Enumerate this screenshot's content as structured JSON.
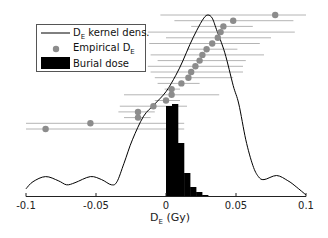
{
  "chart_data": {
    "type": "line",
    "title": "",
    "xlabel": "D_E (Gy)",
    "xlabel_main": "D",
    "xlabel_sub": "E",
    "xlabel_unit": " (Gy)",
    "ylabel": "",
    "xlim": [
      -0.1,
      0.1
    ],
    "x_ticks": [
      -0.1,
      -0.05,
      0,
      0.05,
      0.1
    ],
    "x_tick_labels": [
      "-0.1",
      "-0.05",
      "0",
      "0.05",
      "0.1"
    ],
    "grid": false,
    "legend_position": "upper left",
    "legend": [
      {
        "label_main": "D",
        "label_sub": "E",
        "label_rest": " kernel dens.",
        "type": "line",
        "color": "#000000"
      },
      {
        "label_main": "Empirical D",
        "label_sub": "E",
        "label_rest": "",
        "type": "marker",
        "color": "#8c8c8c"
      },
      {
        "label_main": "Burial dose",
        "label_sub": "",
        "label_rest": "",
        "type": "bar",
        "color": "#000000"
      }
    ],
    "series": [
      {
        "name": "D_E kernel dens.",
        "type": "line",
        "color": "#000000",
        "points": [
          [
            -0.1,
            0.07
          ],
          [
            -0.095,
            0.14
          ],
          [
            -0.086,
            0.19
          ],
          [
            -0.077,
            0.15
          ],
          [
            -0.071,
            0.11
          ],
          [
            -0.065,
            0.13
          ],
          [
            -0.054,
            0.19
          ],
          [
            -0.046,
            0.16
          ],
          [
            -0.039,
            0.11
          ],
          [
            -0.035,
            0.14
          ],
          [
            -0.03,
            0.32
          ],
          [
            -0.024,
            0.55
          ],
          [
            -0.016,
            0.78
          ],
          [
            -0.008,
            0.9
          ],
          [
            0.0,
            1.02
          ],
          [
            0.007,
            1.18
          ],
          [
            0.012,
            1.32
          ],
          [
            0.017,
            1.48
          ],
          [
            0.022,
            1.62
          ],
          [
            0.027,
            1.74
          ],
          [
            0.03,
            1.77
          ],
          [
            0.033,
            1.74
          ],
          [
            0.036,
            1.63
          ],
          [
            0.042,
            1.4
          ],
          [
            0.048,
            1.08
          ],
          [
            0.052,
            0.9
          ],
          [
            0.057,
            0.55
          ],
          [
            0.062,
            0.3
          ],
          [
            0.066,
            0.19
          ],
          [
            0.07,
            0.16
          ],
          [
            0.079,
            0.2
          ],
          [
            0.087,
            0.15
          ],
          [
            0.093,
            0.09
          ],
          [
            0.1,
            0.01
          ]
        ]
      },
      {
        "name": "Empirical D_E",
        "type": "errorbar_scatter",
        "color": "#8c8c8c",
        "points": [
          {
            "x": 0.078,
            "lo": -0.004,
            "hi": 0.1
          },
          {
            "x": 0.048,
            "lo": 0.006,
            "hi": 0.091
          },
          {
            "x": 0.041,
            "lo": 0.018,
            "hi": 0.062
          },
          {
            "x": 0.039,
            "lo": -0.013,
            "hi": 0.092
          },
          {
            "x": 0.037,
            "lo": 0.0,
            "hi": 0.075
          },
          {
            "x": 0.033,
            "lo": -0.012,
            "hi": 0.067
          },
          {
            "x": 0.029,
            "lo": 0.015,
            "hi": 0.051
          },
          {
            "x": 0.026,
            "lo": -0.011,
            "hi": 0.07
          },
          {
            "x": 0.024,
            "lo": -0.006,
            "hi": 0.057
          },
          {
            "x": 0.021,
            "lo": -0.013,
            "hi": 0.055
          },
          {
            "x": 0.018,
            "lo": -0.011,
            "hi": 0.055
          },
          {
            "x": 0.016,
            "lo": -0.008,
            "hi": 0.048
          },
          {
            "x": 0.011,
            "lo": -0.006,
            "hi": 0.024
          },
          {
            "x": 0.004,
            "lo": -0.001,
            "hi": 0.01
          },
          {
            "x": 0.004,
            "lo": -0.03,
            "hi": 0.038
          },
          {
            "x": 0.0,
            "lo": -0.008,
            "hi": 0.01
          },
          {
            "x": -0.009,
            "lo": -0.033,
            "hi": 0.015
          },
          {
            "x": -0.02,
            "lo": -0.034,
            "hi": -0.008
          },
          {
            "x": -0.02,
            "lo": -0.03,
            "hi": -0.011
          },
          {
            "x": -0.054,
            "lo": -0.1,
            "hi": 0.013
          },
          {
            "x": -0.086,
            "lo": -0.1,
            "hi": 0.013
          }
        ]
      },
      {
        "name": "Burial dose",
        "type": "bar",
        "color": "#000000",
        "bin_width": 0.0043,
        "bins": [
          0.0,
          0.0043,
          0.0086,
          0.0129,
          0.0172,
          0.0215,
          0.0258
        ],
        "heights": [
          0.9,
          0.92,
          0.53,
          0.23,
          0.09,
          0.04,
          0.01
        ]
      }
    ]
  }
}
